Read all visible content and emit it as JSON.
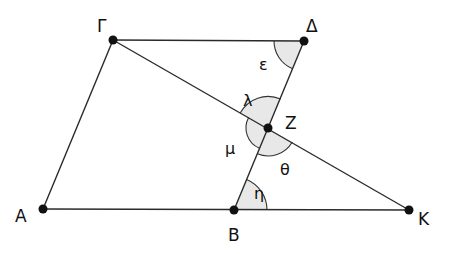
{
  "diagram": {
    "title": "",
    "colors": {
      "line": "#2a2a2a",
      "point": "#111111",
      "arc_fill": "#e8e8e8",
      "arc_stroke": "#333333",
      "label": "#111111"
    },
    "points": [
      {
        "id": "gamma",
        "label": "Γ",
        "x": 113,
        "y": 40,
        "lx": 97,
        "ly": 30
      },
      {
        "id": "delta",
        "label": "Δ",
        "x": 304,
        "y": 41,
        "lx": 308,
        "ly": 30
      },
      {
        "id": "zeta",
        "label": "Z",
        "x": 268,
        "y": 128,
        "lx": 286,
        "ly": 126
      },
      {
        "id": "alpha",
        "label": "A",
        "x": 43,
        "y": 209,
        "lx": 15,
        "ly": 222
      },
      {
        "id": "beta",
        "label": "B",
        "x": 234,
        "y": 210,
        "lx": 228,
        "ly": 240
      },
      {
        "id": "kappa",
        "label": "K",
        "x": 409,
        "y": 210,
        "lx": 419,
        "ly": 224
      }
    ],
    "segments": [
      [
        "gamma",
        "delta"
      ],
      [
        "gamma",
        "alpha"
      ],
      [
        "alpha",
        "kappa"
      ],
      [
        "delta",
        "beta"
      ],
      [
        "gamma",
        "kappa"
      ]
    ],
    "angles": [
      {
        "id": "epsilon",
        "label": "ε",
        "lx": 256,
        "ly": 71
      },
      {
        "id": "lambda",
        "label": "λ",
        "lx": 243,
        "ly": 104
      },
      {
        "id": "mu",
        "label": "μ",
        "lx": 226,
        "ly": 152
      },
      {
        "id": "theta",
        "label": "θ",
        "lx": 281,
        "ly": 174
      },
      {
        "id": "eta",
        "label": "η",
        "lx": 257,
        "ly": 197
      }
    ]
  }
}
